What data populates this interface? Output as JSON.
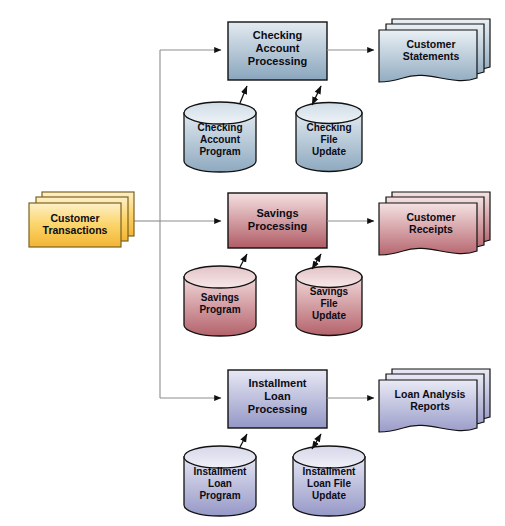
{
  "diagram": {
    "type": "system-flowchart",
    "source": {
      "id": "customer-transactions",
      "shape": "stacked-document-rectangle",
      "label": "Customer\nTransactions",
      "color": "#f6c343"
    },
    "rows": [
      {
        "id": "checking",
        "accent": "#8fa9bd",
        "process": {
          "label": "Checking\nAccount\nProcessing",
          "shape": "process-box"
        },
        "program_store": {
          "label": "Checking\nAccount\nProgram",
          "shape": "cylinder"
        },
        "file_store": {
          "label": "Checking\nFile\nUpdate",
          "shape": "cylinder"
        },
        "output": {
          "label": "Customer\nStatements",
          "shape": "stacked-wavy-document"
        }
      },
      {
        "id": "savings",
        "accent": "#b4606a",
        "process": {
          "label": "Savings\nProcessing",
          "shape": "process-box"
        },
        "program_store": {
          "label": "Savings\nProgram",
          "shape": "cylinder"
        },
        "file_store": {
          "label": "Savings\nFile\nUpdate",
          "shape": "cylinder"
        },
        "output": {
          "label": "Customer\nReceipts",
          "shape": "stacked-wavy-document"
        }
      },
      {
        "id": "installment-loan",
        "accent": "#9a9cc8",
        "process": {
          "label": "Installment\nLoan\nProcessing",
          "shape": "process-box"
        },
        "program_store": {
          "label": "Installment\nLoan\nProgram",
          "shape": "cylinder"
        },
        "file_store": {
          "label": "Installment\nLoan File\nUpdate",
          "shape": "cylinder"
        },
        "output": {
          "label": "Loan Analysis\nReports",
          "shape": "stacked-wavy-document"
        }
      }
    ],
    "connectors": {
      "bus_description": "Customer Transactions feeds a vertical bus that branches to all three processing boxes",
      "program_arrow": "one-way arrow from program cylinder up into processing box",
      "file_arrow": "double-headed arrow between processing box and file update cylinder",
      "output_arrow": "one-way arrow from processing box to output documents"
    }
  }
}
